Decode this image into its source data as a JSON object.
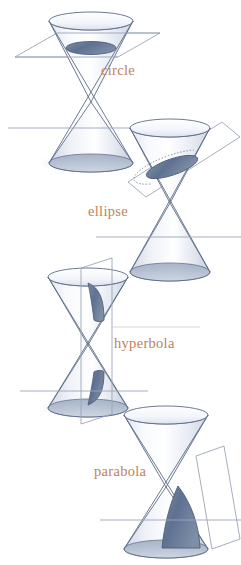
{
  "figure": {
    "name": "conic-sections-diagram",
    "background_color": "#ffffff",
    "palette": {
      "outline": "#5b6b86",
      "outline_light": "#8d9ab0",
      "plane_line": "#9aa5b8",
      "cone_fill_light": "#eef1f6",
      "cone_fill_mid": "#c9d2e0",
      "section_fill": "#6a7c97",
      "section_fill_dark": "#5a6d8a",
      "shadow": "#a9b4c6",
      "label_color": "#c0815a",
      "axis_line": "#9aa5b8"
    },
    "panels": [
      {
        "id": "circle",
        "label": "circle",
        "label_position": {
          "x": 101,
          "y": 63
        },
        "cut_orientation": "horizontal",
        "description": "A horizontal plane cuts the upper nappe of the double cone producing a circle."
      },
      {
        "id": "ellipse",
        "label": "ellipse",
        "label_position": {
          "x": 88,
          "y": 204
        },
        "cut_orientation": "oblique",
        "description": "An oblique plane cuts the upper nappe of the double cone producing an ellipse."
      },
      {
        "id": "hyperbola",
        "label": "hyperbola",
        "label_position": {
          "x": 114,
          "y": 336
        },
        "cut_orientation": "vertical",
        "description": "A vertical plane parallel to the cone axis cuts both nappes producing a hyperbola."
      },
      {
        "id": "parabola",
        "label": "parabola",
        "label_position": {
          "x": 94,
          "y": 464
        },
        "cut_orientation": "parallel-to-slant",
        "description": "A plane parallel to a slant edge cuts one nappe producing a parabola."
      }
    ]
  }
}
